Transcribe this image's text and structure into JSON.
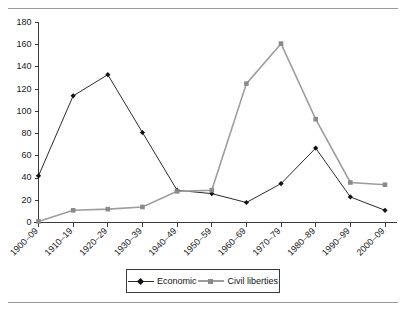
{
  "figure": {
    "top_rule": "horizontal-rule",
    "bottom_rule": "horizontal-rule"
  },
  "chart_data": {
    "type": "line",
    "title": "",
    "subtitle": "",
    "xlabel": "",
    "ylabel": "",
    "categories": [
      "1900–09",
      "1910–19",
      "1920–29",
      "1930–39",
      "1940–49",
      "1950–59",
      "1960–69",
      "1970–79",
      "1980–89",
      "1990–99",
      "2000–09"
    ],
    "series": [
      {
        "name": "Economic",
        "marker": "diamond",
        "color": "#2b2b2b",
        "values": [
          42,
          114,
          133,
          81,
          29,
          26,
          18,
          35,
          67,
          23,
          11
        ]
      },
      {
        "name": "Civil liberties",
        "marker": "square",
        "color": "#9d9d9d",
        "values": [
          1,
          11,
          12,
          14,
          28,
          29,
          125,
          161,
          93,
          36,
          34
        ]
      }
    ],
    "ylim": [
      0,
      180
    ],
    "yticks": [
      0,
      20,
      40,
      60,
      80,
      100,
      120,
      140,
      160,
      180
    ],
    "ytick_labels": [
      "0",
      "20",
      "40",
      "60",
      "80",
      "100",
      "120",
      "140",
      "160",
      "180"
    ],
    "grid": false,
    "legend_position": "bottom-center",
    "xtick_rotation": 45
  },
  "legend": {
    "entries": [
      {
        "label": "Economic",
        "marker": "diamond-marker-icon"
      },
      {
        "label": "Civil liberties",
        "marker": "square-marker-icon"
      }
    ]
  }
}
